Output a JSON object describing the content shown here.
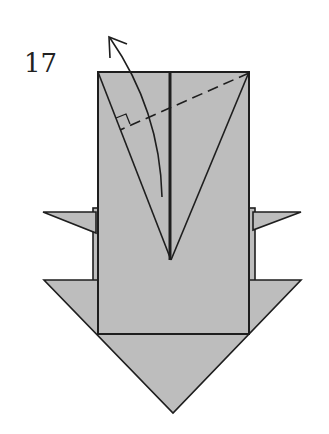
{
  "diagram": {
    "step_number": "17",
    "colors": {
      "paper_fill": "#bdbdbd",
      "line": "#1e1e1e",
      "background": "#ffffff"
    },
    "annotations": {
      "fold_line": "dashed valley fold from top-right corner",
      "right_angle_marker": "perpendicular symbol",
      "arrow": "curved fold arrow pointing up-left"
    }
  }
}
